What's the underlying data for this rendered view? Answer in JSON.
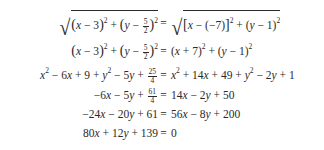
{
  "equations": [
    {
      "lhs": "√((x − 3)² + (y − 5/2)²)",
      "rhs": "√([x − (−7)]² + (y − 1)²)"
    },
    {
      "lhs": "(x − 3)² + (y − 5/2)²",
      "rhs": "(x + 7)² + (y − 1)²"
    },
    {
      "lhs": "x² − 6x + 9 + y² − 5y + 25/4",
      "rhs": "x² + 14x + 49 + y² − 2y + 1"
    },
    {
      "lhs": "−6x − 5y + 61/4",
      "rhs": "14x − 2y + 50"
    },
    {
      "lhs": "−24x − 20y + 61",
      "rhs": "56x − 8y + 200"
    },
    {
      "lhs": "80x + 12y + 139",
      "rhs": "0"
    }
  ],
  "symbols": {
    "equals": "="
  },
  "fractions": {
    "five_halves": {
      "num": "5",
      "den": "2"
    },
    "twentyfive_fourths": {
      "num": "25",
      "den": "4"
    },
    "sixtyone_fourths": {
      "num": "61",
      "den": "4"
    }
  }
}
